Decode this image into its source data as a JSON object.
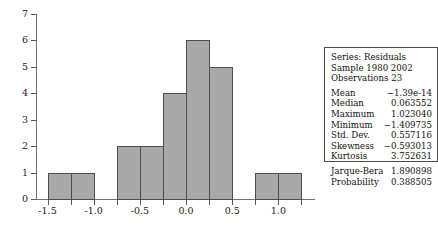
{
  "chart_data": {
    "type": "bar",
    "title": "",
    "xlabel": "",
    "ylabel": "",
    "xlim": [
      -1.625,
      1.375
    ],
    "ylim": [
      0,
      7
    ],
    "grid": false,
    "bin_width": 0.25,
    "legend_position": "none",
    "x_ticks": [
      "-1.5",
      "-1.0",
      "-0.5",
      "0.0",
      "0.5",
      "1.0"
    ],
    "x_tick_values": [
      -1.5,
      -1.0,
      -0.5,
      0.0,
      0.5,
      1.0
    ],
    "y_ticks": [
      "0",
      "1",
      "2",
      "3",
      "4",
      "5",
      "6",
      "7"
    ],
    "y_tick_values": [
      0,
      1,
      2,
      3,
      4,
      5,
      6,
      7
    ],
    "bars": [
      {
        "bin_start": -1.5,
        "bin_end": -1.25,
        "value": 1
      },
      {
        "bin_start": -1.25,
        "bin_end": -1.0,
        "value": 1
      },
      {
        "bin_start": -0.75,
        "bin_end": -0.5,
        "value": 2
      },
      {
        "bin_start": -0.5,
        "bin_end": -0.25,
        "value": 2
      },
      {
        "bin_start": -0.25,
        "bin_end": 0.0,
        "value": 4
      },
      {
        "bin_start": 0.0,
        "bin_end": 0.25,
        "value": 6
      },
      {
        "bin_start": 0.25,
        "bin_end": 0.5,
        "value": 5
      },
      {
        "bin_start": 0.75,
        "bin_end": 1.0,
        "value": 1
      },
      {
        "bin_start": 1.0,
        "bin_end": 1.25,
        "value": 1
      }
    ],
    "bar_fill_color": "#a9a9a9",
    "bar_edge_color": "#4d4d4d",
    "axis_color": "#737373"
  },
  "stats": {
    "header": [
      "Series: Residuals",
      "Sample 1980 2002",
      "Observations 23"
    ],
    "moments": [
      {
        "label": "Mean",
        "value": "−1.39e-14"
      },
      {
        "label": "Median",
        "value": "0.063552"
      },
      {
        "label": "Maximum",
        "value": "1.023040"
      },
      {
        "label": "Minimum",
        "value": "−1.409735"
      },
      {
        "label": "Std. Dev.",
        "value": "0.557116"
      },
      {
        "label": "Skewness",
        "value": "−0.593013"
      },
      {
        "label": "Kurtosis",
        "value": "3.752631"
      }
    ],
    "tests": [
      {
        "label": "Jarque-Bera",
        "value": "1.890898"
      },
      {
        "label": "Probability",
        "value": "0.388505"
      }
    ]
  }
}
